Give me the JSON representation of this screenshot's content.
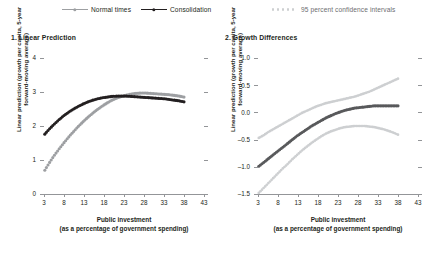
{
  "legend": {
    "items": [
      {
        "label": "Normal times",
        "marker": "line-dot-marker",
        "color": "#9d9fa2"
      },
      {
        "label": "Consolidation",
        "marker": "line-dot-marker",
        "color": "#231f20"
      },
      {
        "label": "95 percent confidence intervals",
        "marker": "dotted-marker",
        "color": "#cdcfd1"
      }
    ]
  },
  "chart_data": [
    {
      "type": "line",
      "title": "1. Linear Prediction",
      "xlabel": "Public investment\n(as a percentage of government spending)",
      "xlabel_line1": "Public investment",
      "xlabel_line2": "(as a percentage of government spending)",
      "ylabel": "Linear prediction (growth per capita, 5-year forward-moving average)",
      "ylabel_line1": "Linear prediction (growth per capita, 5-year",
      "ylabel_line2": "forward-moving average)",
      "xlim": [
        3,
        43
      ],
      "ylim": [
        0,
        4
      ],
      "xticks": [
        3,
        8,
        13,
        18,
        23,
        28,
        33,
        38,
        43
      ],
      "yticks": [
        0,
        1,
        2,
        3,
        4
      ],
      "ytick_labels": [
        "0",
        "1",
        "2",
        "3",
        "4"
      ],
      "grid": false,
      "legend_position": "top-center",
      "series": [
        {
          "name": "Normal times",
          "color": "#9d9fa2",
          "x": [
            3.2,
            4.4,
            5.6,
            6.8,
            8.0,
            9.2,
            10.4,
            11.6,
            12.8,
            14.0,
            15.2,
            16.4,
            17.6,
            18.8,
            20.0,
            21.2,
            22.4,
            23.6,
            24.8,
            26.0,
            27.2,
            28.4,
            29.6,
            30.8,
            32.0,
            33.2,
            34.4,
            35.6,
            36.8,
            38.0
          ],
          "values": [
            0.7,
            0.93,
            1.14,
            1.33,
            1.51,
            1.68,
            1.84,
            1.99,
            2.13,
            2.26,
            2.38,
            2.49,
            2.59,
            2.68,
            2.76,
            2.82,
            2.87,
            2.91,
            2.94,
            2.96,
            2.97,
            2.97,
            2.96,
            2.95,
            2.94,
            2.93,
            2.92,
            2.9,
            2.88,
            2.85
          ]
        },
        {
          "name": "Consolidation",
          "color": "#231f20",
          "x": [
            3.2,
            4.4,
            5.6,
            6.8,
            8.0,
            9.2,
            10.4,
            11.6,
            12.8,
            14.0,
            15.2,
            16.4,
            17.6,
            18.8,
            20.0,
            21.2,
            22.4,
            23.6,
            24.8,
            26.0,
            27.2,
            28.4,
            29.6,
            30.8,
            32.0,
            33.2,
            34.4,
            35.6,
            36.8,
            38.0
          ],
          "values": [
            1.76,
            1.92,
            2.06,
            2.19,
            2.31,
            2.41,
            2.5,
            2.58,
            2.65,
            2.71,
            2.76,
            2.8,
            2.83,
            2.85,
            2.87,
            2.88,
            2.88,
            2.88,
            2.87,
            2.86,
            2.85,
            2.84,
            2.83,
            2.82,
            2.81,
            2.8,
            2.78,
            2.76,
            2.74,
            2.71
          ]
        }
      ]
    },
    {
      "type": "line",
      "title": "2. Growth Differences",
      "xlabel": "Public investment\n(as a percentage of government spending)",
      "xlabel_line1": "Public investment",
      "xlabel_line2": "(as a percentage of government spending)",
      "ylabel": "Linear prediction (growth per capita, 5-year forward-moving average)",
      "ylabel_line1": "Linear prediction (growth per capita, 5-year",
      "ylabel_line2": "forward-moving average)",
      "xlim": [
        3,
        43
      ],
      "ylim": [
        -1.5,
        1.0
      ],
      "xticks": [
        3,
        8,
        13,
        18,
        23,
        28,
        33,
        38,
        43
      ],
      "yticks": [
        -1.5,
        -1.0,
        -0.5,
        0.0,
        0.5,
        1.0
      ],
      "ytick_labels": [
        "–1.5",
        "–1.0",
        "–0.5",
        "0.0",
        "0.5",
        "1.0"
      ],
      "grid": false,
      "legend_position": "top-right",
      "series": [
        {
          "name": "Growth difference",
          "color": "#58595b",
          "x": [
            3.2,
            4.4,
            5.6,
            6.8,
            8.0,
            9.2,
            10.4,
            11.6,
            12.8,
            14.0,
            15.2,
            16.4,
            17.6,
            18.8,
            20.0,
            21.2,
            22.4,
            23.6,
            24.8,
            26.0,
            27.2,
            28.4,
            29.6,
            30.8,
            32.0,
            33.2,
            34.4,
            35.6,
            36.8,
            38.0
          ],
          "values": [
            -0.99,
            -0.92,
            -0.85,
            -0.78,
            -0.71,
            -0.64,
            -0.57,
            -0.5,
            -0.43,
            -0.37,
            -0.31,
            -0.25,
            -0.2,
            -0.15,
            -0.1,
            -0.06,
            -0.02,
            0.01,
            0.04,
            0.06,
            0.08,
            0.09,
            0.1,
            0.11,
            0.12,
            0.12,
            0.12,
            0.12,
            0.12,
            0.12
          ]
        },
        {
          "name": "Upper 95 percent confidence interval",
          "color": "#cdcfd1",
          "x": [
            3.2,
            4.4,
            5.6,
            6.8,
            8.0,
            9.2,
            10.4,
            11.6,
            12.8,
            14.0,
            15.2,
            16.4,
            17.6,
            18.8,
            20.0,
            21.2,
            22.4,
            23.6,
            24.8,
            26.0,
            27.2,
            28.4,
            29.6,
            30.8,
            32.0,
            33.2,
            34.4,
            35.6,
            36.8,
            38.0
          ],
          "values": [
            -0.47,
            -0.42,
            -0.36,
            -0.31,
            -0.26,
            -0.21,
            -0.16,
            -0.11,
            -0.06,
            -0.01,
            0.03,
            0.07,
            0.11,
            0.14,
            0.17,
            0.19,
            0.21,
            0.23,
            0.25,
            0.27,
            0.29,
            0.32,
            0.35,
            0.38,
            0.42,
            0.46,
            0.5,
            0.54,
            0.58,
            0.62
          ]
        },
        {
          "name": "Lower 95 percent confidence interval",
          "color": "#cdcfd1",
          "x": [
            3.2,
            4.4,
            5.6,
            6.8,
            8.0,
            9.2,
            10.4,
            11.6,
            12.8,
            14.0,
            15.2,
            16.4,
            17.6,
            18.8,
            20.0,
            21.2,
            22.4,
            23.6,
            24.8,
            26.0,
            27.2,
            28.4,
            29.6,
            30.8,
            32.0,
            33.2,
            34.4,
            35.6,
            36.8,
            38.0
          ],
          "values": [
            -1.48,
            -1.39,
            -1.3,
            -1.21,
            -1.12,
            -1.03,
            -0.95,
            -0.86,
            -0.78,
            -0.7,
            -0.63,
            -0.56,
            -0.5,
            -0.44,
            -0.39,
            -0.35,
            -0.32,
            -0.29,
            -0.27,
            -0.26,
            -0.25,
            -0.25,
            -0.25,
            -0.26,
            -0.27,
            -0.29,
            -0.31,
            -0.34,
            -0.37,
            -0.41
          ]
        }
      ]
    }
  ]
}
